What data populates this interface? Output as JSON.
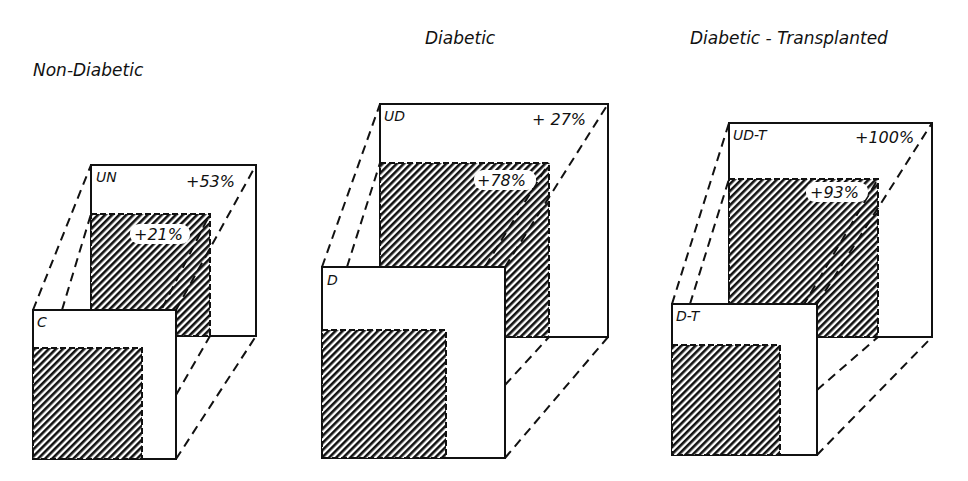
{
  "figure": {
    "panels": [
      {
        "title": "Non-Diabetic",
        "back_label": "UN",
        "front_label": "C",
        "outer_change": "+53%",
        "inner_change": "+21%",
        "back": {
          "x1": 91,
          "y1": 165,
          "x2": 256,
          "y2": 336
        },
        "back_inner": {
          "x1": 91,
          "y1": 214,
          "x2": 210,
          "y2": 336
        },
        "front": {
          "x1": 33,
          "y1": 310,
          "x2": 176,
          "y2": 459
        },
        "front_inner": {
          "x1": 33,
          "y1": 348,
          "x2": 142,
          "y2": 459
        },
        "title_pos": {
          "x": 33,
          "y": 76
        }
      },
      {
        "title": "Diabetic",
        "back_label": "UD",
        "front_label": "D",
        "outer_change": "+ 27%",
        "inner_change": "+78%",
        "back": {
          "x1": 380,
          "y1": 104,
          "x2": 608,
          "y2": 337
        },
        "back_inner": {
          "x1": 380,
          "y1": 163,
          "x2": 549,
          "y2": 337
        },
        "front": {
          "x1": 322,
          "y1": 267,
          "x2": 505,
          "y2": 458
        },
        "front_inner": {
          "x1": 322,
          "y1": 330,
          "x2": 446,
          "y2": 458
        },
        "title_pos": {
          "x": 425,
          "y": 44
        }
      },
      {
        "title": "Diabetic - Transplanted",
        "back_label": "UD-T",
        "front_label": "D-T",
        "outer_change": "+100%",
        "inner_change": "+93%",
        "back": {
          "x1": 729,
          "y1": 123,
          "x2": 932,
          "y2": 337
        },
        "back_inner": {
          "x1": 729,
          "y1": 179,
          "x2": 878,
          "y2": 337
        },
        "front": {
          "x1": 672,
          "y1": 304,
          "x2": 817,
          "y2": 455
        },
        "front_inner": {
          "x1": 672,
          "y1": 345,
          "x2": 780,
          "y2": 455
        },
        "title_pos": {
          "x": 690,
          "y": 44
        }
      }
    ],
    "colors": {
      "ink": "#111111",
      "paper": "#ffffff"
    }
  }
}
